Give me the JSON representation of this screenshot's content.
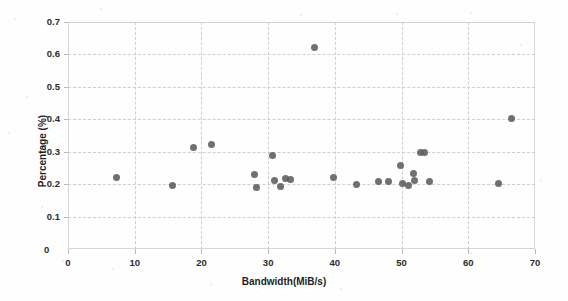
{
  "chart_data": {
    "type": "scatter",
    "title": "",
    "xlabel": "Bandwidth(MiB/s)",
    "ylabel": "Percentage (%)",
    "xlim": [
      0,
      70
    ],
    "ylim": [
      0,
      0.7
    ],
    "xticks": [
      0,
      10,
      20,
      30,
      40,
      50,
      60,
      70
    ],
    "xtick_labels": [
      "0",
      "10",
      "20",
      "30",
      "40",
      "50",
      "60",
      "70"
    ],
    "yticks": [
      0,
      0.1,
      0.2,
      0.3,
      0.4,
      0.5,
      0.6,
      0.7
    ],
    "ytick_labels": [
      "0",
      "0.1",
      "0.2",
      "0.3",
      "0.4",
      "0.5",
      "0.6",
      "0.7"
    ],
    "grid": true,
    "legend": false,
    "marker_color": "#5c5c5c",
    "series": [
      {
        "name": "measurements",
        "x": [
          7.3,
          15.6,
          18.8,
          21.5,
          27.9,
          28.3,
          30.7,
          31.0,
          31.8,
          32.6,
          33.4,
          36.9,
          39.8,
          43.3,
          46.5,
          48.0,
          49.9,
          50.2,
          51.0,
          51.8,
          52.0,
          52.9,
          53.4,
          54.2,
          64.5,
          66.5
        ],
        "y": [
          0.222,
          0.196,
          0.313,
          0.321,
          0.231,
          0.19,
          0.288,
          0.212,
          0.193,
          0.217,
          0.213,
          0.62,
          0.222,
          0.199,
          0.207,
          0.207,
          0.256,
          0.203,
          0.197,
          0.234,
          0.212,
          0.299,
          0.298,
          0.207,
          0.201,
          0.401
        ]
      }
    ]
  },
  "axes": {
    "origin_label": "0"
  }
}
